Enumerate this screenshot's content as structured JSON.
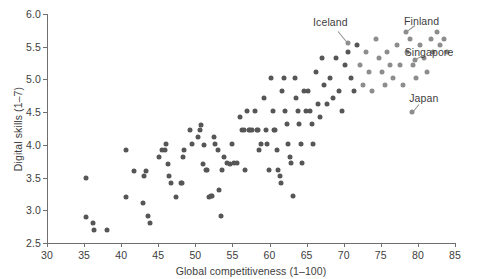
{
  "chart_data": {
    "type": "scatter",
    "title": "",
    "xlabel": "Global competitiveness (1–100)",
    "ylabel": "Digital skills (1–7)",
    "xlim": [
      30,
      85
    ],
    "ylim": [
      2.5,
      6.0
    ],
    "xticks": [
      30,
      35,
      40,
      45,
      50,
      55,
      60,
      65,
      70,
      75,
      80,
      85
    ],
    "xtick_labels": [
      "30",
      "35",
      "40",
      "45",
      "50",
      "55",
      "60",
      "65",
      "70",
      "75",
      "80",
      "85"
    ],
    "yticks": [
      2.5,
      3.0,
      3.5,
      4.0,
      4.5,
      5.0,
      5.5,
      6.0
    ],
    "ytick_labels": [
      "2.5",
      "3.0",
      "3.5",
      "4.0",
      "4.5",
      "5.0",
      "5.5",
      "6.0"
    ],
    "grid": false,
    "legend": null,
    "marker_color": "#565656",
    "marker_color_light": "#8d8d8d",
    "axis_color": "#6f6f6f",
    "text_color": "#3d3d3d",
    "points": [
      [
        35.2,
        3.5
      ],
      [
        35.3,
        2.9
      ],
      [
        36.2,
        2.8
      ],
      [
        36.4,
        2.7
      ],
      [
        38.1,
        2.7
      ],
      [
        40.6,
        3.92
      ],
      [
        40.7,
        3.21
      ],
      [
        41.7,
        3.6
      ],
      [
        42.9,
        3.11
      ],
      [
        43.1,
        3.52
      ],
      [
        43.3,
        3.6
      ],
      [
        43.6,
        2.91
      ],
      [
        43.9,
        2.81
      ],
      [
        45.1,
        3.81
      ],
      [
        45.5,
        3.92
      ],
      [
        45.9,
        3.92
      ],
      [
        46.1,
        4.01
      ],
      [
        46.3,
        3.71
      ],
      [
        46.5,
        3.52
      ],
      [
        46.7,
        3.42
      ],
      [
        47.4,
        3.21
      ],
      [
        48.0,
        3.41
      ],
      [
        48.2,
        3.41
      ],
      [
        48.3,
        3.81
      ],
      [
        48.5,
        3.92
      ],
      [
        49.3,
        4.22
      ],
      [
        49.6,
        4.02
      ],
      [
        50.3,
        4.12
      ],
      [
        50.6,
        4.22
      ],
      [
        50.8,
        4.31
      ],
      [
        51.0,
        3.71
      ],
      [
        51.2,
        4.0
      ],
      [
        51.4,
        3.62
      ],
      [
        51.6,
        3.62
      ],
      [
        51.8,
        3.21
      ],
      [
        52.1,
        3.22
      ],
      [
        52.3,
        3.22
      ],
      [
        52.5,
        4.12
      ],
      [
        52.7,
        4.01
      ],
      [
        53.0,
        3.92
      ],
      [
        53.2,
        3.31
      ],
      [
        53.4,
        2.91
      ],
      [
        53.6,
        3.62
      ],
      [
        53.9,
        3.82
      ],
      [
        54.3,
        3.72
      ],
      [
        54.7,
        3.71
      ],
      [
        55.0,
        4.02
      ],
      [
        55.2,
        3.72
      ],
      [
        55.6,
        3.72
      ],
      [
        56.0,
        4.42
      ],
      [
        56.3,
        4.22
      ],
      [
        56.5,
        4.22
      ],
      [
        56.7,
        3.62
      ],
      [
        57.0,
        4.52
      ],
      [
        57.2,
        4.22
      ],
      [
        57.4,
        4.22
      ],
      [
        57.6,
        4.22
      ],
      [
        58.0,
        4.52
      ],
      [
        58.3,
        4.22
      ],
      [
        58.5,
        4.22
      ],
      [
        58.6,
        3.92
      ],
      [
        58.9,
        4.02
      ],
      [
        59.2,
        4.72
      ],
      [
        59.5,
        4.22
      ],
      [
        59.7,
        4.02
      ],
      [
        59.9,
        3.62
      ],
      [
        60.2,
        5.02
      ],
      [
        60.4,
        4.52
      ],
      [
        60.6,
        4.22
      ],
      [
        60.8,
        4.22
      ],
      [
        61.0,
        3.92
      ],
      [
        61.2,
        3.62
      ],
      [
        61.4,
        3.52
      ],
      [
        61.5,
        3.42
      ],
      [
        61.7,
        4.82
      ],
      [
        61.9,
        5.02
      ],
      [
        62.1,
        4.52
      ],
      [
        62.3,
        4.32
      ],
      [
        62.5,
        4.02
      ],
      [
        62.7,
        3.82
      ],
      [
        62.9,
        3.72
      ],
      [
        63.1,
        3.22
      ],
      [
        63.4,
        5.02
      ],
      [
        63.6,
        4.72
      ],
      [
        63.8,
        4.52
      ],
      [
        64.0,
        4.32
      ],
      [
        64.2,
        4.02
      ],
      [
        64.4,
        3.72
      ],
      [
        64.6,
        4.82
      ],
      [
        64.9,
        4.52
      ],
      [
        65.2,
        4.82
      ],
      [
        65.5,
        4.52
      ],
      [
        65.7,
        4.32
      ],
      [
        65.9,
        4.02
      ],
      [
        66.2,
        5.12
      ],
      [
        66.5,
        4.62
      ],
      [
        66.8,
        4.42
      ],
      [
        67.1,
        5.32
      ],
      [
        67.4,
        4.92
      ],
      [
        67.8,
        4.62
      ],
      [
        68.2,
        5.02
      ],
      [
        68.6,
        4.72
      ],
      [
        69.0,
        5.32
      ],
      [
        69.4,
        4.82
      ],
      [
        69.8,
        4.52
      ],
      [
        70.2,
        5.22
      ],
      [
        70.6,
        5.42
      ],
      [
        71.0,
        5.02
      ],
      [
        71.4,
        4.82
      ],
      [
        71.8,
        5.52
      ],
      [
        72.2,
        5.22
      ],
      [
        72.6,
        4.92
      ],
      [
        73.0,
        5.42
      ],
      [
        73.4,
        5.12
      ],
      [
        73.8,
        4.82
      ],
      [
        74.3,
        5.62
      ],
      [
        74.7,
        5.32
      ],
      [
        75.1,
        5.12
      ],
      [
        75.5,
        4.92
      ],
      [
        75.9,
        5.42
      ],
      [
        76.3,
        5.22
      ],
      [
        76.7,
        5.02
      ],
      [
        77.2,
        5.52
      ],
      [
        77.6,
        5.22
      ],
      [
        78.0,
        4.92
      ],
      [
        78.5,
        5.42
      ],
      [
        79.0,
        5.62
      ],
      [
        79.4,
        5.22
      ],
      [
        79.8,
        5.02
      ],
      [
        80.3,
        5.52
      ],
      [
        80.8,
        5.32
      ],
      [
        81.2,
        5.12
      ],
      [
        81.7,
        5.62
      ],
      [
        82.1,
        5.42
      ],
      [
        82.6,
        5.72
      ],
      [
        83.0,
        5.52
      ],
      [
        83.5,
        5.62
      ],
      [
        83.9,
        5.42
      ]
    ],
    "light_points_from_x": 72,
    "annotations": [
      {
        "label": "Iceland",
        "label_x": 68.2,
        "label_y": 5.88,
        "point_x": 70.6,
        "point_y": 5.55
      },
      {
        "label": "Finland",
        "label_x": 80.5,
        "label_y": 5.9,
        "point_x": 78.4,
        "point_y": 5.72
      },
      {
        "label": "Singapore",
        "label_x": 81.5,
        "label_y": 5.42,
        "point_x": 79.6,
        "point_y": 5.3
      },
      {
        "label": "Japan",
        "label_x": 80.8,
        "label_y": 4.72,
        "point_x": 79.2,
        "point_y": 4.5
      }
    ]
  }
}
